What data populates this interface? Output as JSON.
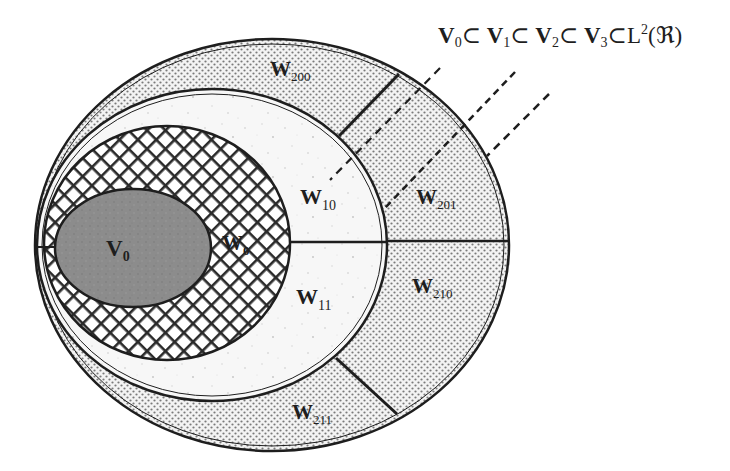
{
  "diagram": {
    "title_formula": {
      "parts": [
        {
          "base": "V",
          "sub": "0"
        },
        {
          "op": "⊂"
        },
        {
          "base": "V",
          "sub": "1"
        },
        {
          "op": "⊂"
        },
        {
          "base": "V",
          "sub": "2"
        },
        {
          "op": "⊂"
        },
        {
          "base": "V",
          "sub": "3"
        },
        {
          "op": "⊂"
        },
        {
          "text": "L",
          "sup": "2",
          "arg": "(ℜ)"
        }
      ]
    },
    "regions": [
      {
        "id": "V0",
        "base": "V",
        "sub": "0",
        "fill": "gray-stipple"
      },
      {
        "id": "W0",
        "base": "W",
        "sub": "0",
        "fill": "cross-hatch"
      },
      {
        "id": "W10",
        "base": "W",
        "sub": "10",
        "fill": "light-speckle"
      },
      {
        "id": "W11",
        "base": "W",
        "sub": "11",
        "fill": "light-speckle"
      },
      {
        "id": "W200",
        "base": "W",
        "sub": "200",
        "fill": "dots"
      },
      {
        "id": "W201",
        "base": "W",
        "sub": "201",
        "fill": "dots"
      },
      {
        "id": "W210",
        "base": "W",
        "sub": "210",
        "fill": "dots"
      },
      {
        "id": "W211",
        "base": "W",
        "sub": "211",
        "fill": "dots"
      }
    ],
    "colors": {
      "stroke": "#1e1e1e",
      "v0_fill": "#8a8a8a",
      "dot_bg": "#f3f3f3",
      "dot": "#7a7a7a",
      "speckle_bg": "#f7f7f7",
      "hatch": "#2a2a2a"
    }
  }
}
